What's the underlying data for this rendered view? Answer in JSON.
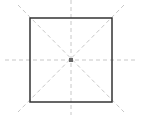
{
  "diagram": {
    "square": {
      "x": 30,
      "y": 18,
      "width": 82,
      "height": 84,
      "stroke": "#333333",
      "stroke_width": 1.5
    },
    "center": {
      "x": 71,
      "y": 60,
      "color": "#666666",
      "size": 4
    },
    "guides": {
      "color": "#c8c8c8",
      "dash": "4 3",
      "horizontal": {
        "x1": 5,
        "y1": 60,
        "x2": 137,
        "y2": 60
      },
      "vertical": {
        "x1": 71,
        "y1": 0,
        "x2": 71,
        "y2": 115
      },
      "diagonal_1": {
        "x1": 18,
        "y1": 5,
        "x2": 124,
        "y2": 112
      },
      "diagonal_2": {
        "x1": 124,
        "y1": 5,
        "x2": 18,
        "y2": 112
      }
    }
  }
}
